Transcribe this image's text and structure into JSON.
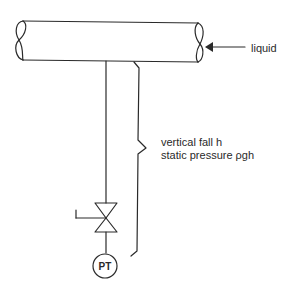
{
  "diagram": {
    "type": "process-instrumentation",
    "labels": {
      "flow": "liquid",
      "fall": "vertical fall h",
      "pressure": "static pressure ρgh",
      "instrument": "PT"
    },
    "components": [
      {
        "id": "pipe",
        "kind": "horizontal-pipe"
      },
      {
        "id": "impulse-line",
        "kind": "vertical-line"
      },
      {
        "id": "valve",
        "kind": "isolation-valve-with-handle"
      },
      {
        "id": "transmitter",
        "kind": "pressure-transmitter",
        "tag": "PT"
      },
      {
        "id": "brace",
        "kind": "dimension-brace"
      },
      {
        "id": "flow-arrow",
        "kind": "arrow",
        "direction": "left"
      }
    ],
    "colors": {
      "line": "#2a2a2a",
      "background": "#ffffff"
    }
  }
}
